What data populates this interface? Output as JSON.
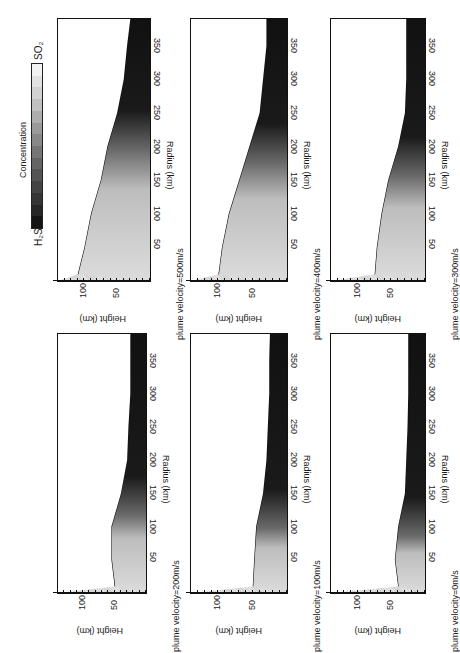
{
  "figure": {
    "orientation": "rotated 90 degrees clockwise",
    "colorbar": {
      "title": "Concentration",
      "top_label": "SO₂",
      "bottom_label": "H₂S",
      "bands": [
        "#f2f2f2",
        "#e2e2e2",
        "#d2d2d2",
        "#c0c0c0",
        "#adadad",
        "#9a9a9a",
        "#888888",
        "#767676",
        "#646464",
        "#545454",
        "#444444",
        "#353535",
        "#272727",
        "#151515"
      ]
    },
    "axes": {
      "xlabel": "Radius (km)",
      "ylabel": "Height (km)",
      "xticks": [
        "50",
        "100",
        "150",
        "200",
        "250",
        "300",
        "350"
      ],
      "yticks": [
        "50",
        "100"
      ]
    },
    "panels": [
      {
        "id": "p500",
        "label": "plume velocity=500m/s"
      },
      {
        "id": "p400",
        "label": "plume velocity=400m/s"
      },
      {
        "id": "p300",
        "label": "plume velocity=300m/s"
      },
      {
        "id": "p200",
        "label": "plume velocity=200m/s"
      },
      {
        "id": "p100",
        "label": "plume velocity=100m/s"
      },
      {
        "id": "p0",
        "label": "plume velocity=0m/s"
      }
    ]
  },
  "chart_data": [
    {
      "type": "heatmap",
      "title": "plume velocity=500m/s",
      "xlabel": "Radius (km)",
      "ylabel": "Height (km)",
      "xlim": [
        0,
        390
      ],
      "ylim": [
        0,
        140
      ],
      "legend": "Concentration H2S (dark) to SO2 (light)",
      "sulfur_boundary_height_km": [
        [
          10,
          110
        ],
        [
          50,
          100
        ],
        [
          100,
          90
        ],
        [
          150,
          75
        ],
        [
          200,
          65
        ],
        [
          250,
          50
        ],
        [
          300,
          40
        ],
        [
          350,
          35
        ],
        [
          390,
          30
        ]
      ]
    },
    {
      "type": "heatmap",
      "title": "plume velocity=400m/s",
      "xlabel": "Radius (km)",
      "ylabel": "Height (km)",
      "xlim": [
        0,
        390
      ],
      "ylim": [
        0,
        140
      ],
      "sulfur_boundary_height_km": [
        [
          10,
          100
        ],
        [
          50,
          95
        ],
        [
          100,
          85
        ],
        [
          150,
          70
        ],
        [
          200,
          55
        ],
        [
          250,
          40
        ],
        [
          300,
          35
        ],
        [
          350,
          30
        ],
        [
          390,
          30
        ]
      ]
    },
    {
      "type": "heatmap",
      "title": "plume velocity=300m/s",
      "xlabel": "Radius (km)",
      "ylabel": "Height (km)",
      "xlim": [
        0,
        390
      ],
      "ylim": [
        0,
        140
      ],
      "sulfur_boundary_height_km": [
        [
          10,
          75
        ],
        [
          50,
          72
        ],
        [
          100,
          65
        ],
        [
          150,
          55
        ],
        [
          200,
          40
        ],
        [
          250,
          30
        ],
        [
          300,
          28
        ],
        [
          350,
          28
        ],
        [
          390,
          28
        ]
      ]
    },
    {
      "type": "heatmap",
      "title": "plume velocity=200m/s",
      "xlabel": "Radius (km)",
      "ylabel": "Height (km)",
      "xlim": [
        0,
        390
      ],
      "ylim": [
        0,
        140
      ],
      "sulfur_boundary_height_km": [
        [
          10,
          50
        ],
        [
          50,
          55
        ],
        [
          100,
          55
        ],
        [
          150,
          40
        ],
        [
          200,
          30
        ],
        [
          250,
          28
        ],
        [
          300,
          25
        ],
        [
          350,
          25
        ],
        [
          390,
          25
        ]
      ]
    },
    {
      "type": "heatmap",
      "title": "plume velocity=100m/s",
      "xlabel": "Radius (km)",
      "ylabel": "Height (km)",
      "xlim": [
        0,
        390
      ],
      "ylim": [
        0,
        140
      ],
      "sulfur_boundary_height_km": [
        [
          10,
          50
        ],
        [
          50,
          48
        ],
        [
          100,
          45
        ],
        [
          150,
          35
        ],
        [
          200,
          30
        ],
        [
          250,
          28
        ],
        [
          300,
          26
        ],
        [
          350,
          26
        ],
        [
          390,
          25
        ]
      ]
    },
    {
      "type": "heatmap",
      "title": "plume velocity=0m/s",
      "xlabel": "Radius (km)",
      "ylabel": "Height (km)",
      "xlim": [
        0,
        390
      ],
      "ylim": [
        0,
        140
      ],
      "sulfur_boundary_height_km": [
        [
          10,
          40
        ],
        [
          50,
          45
        ],
        [
          100,
          40
        ],
        [
          150,
          30
        ],
        [
          200,
          28
        ],
        [
          250,
          26
        ],
        [
          300,
          25
        ],
        [
          350,
          25
        ],
        [
          390,
          25
        ]
      ]
    }
  ]
}
